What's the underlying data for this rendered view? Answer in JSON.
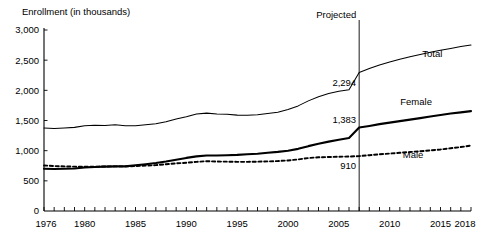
{
  "chart_data": {
    "type": "line",
    "title": "Enrollment (in thousands)",
    "xlabel": "",
    "ylabel": "Enrollment (in thousands)",
    "xlim": [
      1976,
      2018
    ],
    "ylim": [
      0,
      3000
    ],
    "grid": false,
    "legend_position": "inline-right",
    "y_ticks": [
      "0",
      "500",
      "1,000",
      "1,500",
      "2,000",
      "2,500",
      "3,000"
    ],
    "y_tick_values": [
      0,
      500,
      1000,
      1500,
      2000,
      2500,
      3000
    ],
    "x_ticks": [
      "1976",
      "1980",
      "1985",
      "1990",
      "1995",
      "2000",
      "2005",
      "2010",
      "2015",
      "2018"
    ],
    "x_tick_values": [
      1976,
      1980,
      1985,
      1990,
      1995,
      2000,
      2005,
      2010,
      2015,
      2018
    ],
    "x": [
      1976,
      1977,
      1978,
      1979,
      1980,
      1981,
      1982,
      1983,
      1984,
      1985,
      1986,
      1987,
      1988,
      1989,
      1990,
      1991,
      1992,
      1993,
      1994,
      1995,
      1996,
      1997,
      1998,
      1999,
      2000,
      2001,
      2002,
      2003,
      2004,
      2005,
      2006,
      2007,
      2008,
      2009,
      2010,
      2011,
      2012,
      2013,
      2014,
      2015,
      2016,
      2017,
      2018
    ],
    "series": [
      {
        "name": "Total",
        "style": "thin-solid",
        "values": [
          1377,
          1366,
          1375,
          1386,
          1412,
          1422,
          1416,
          1430,
          1412,
          1412,
          1430,
          1447,
          1479,
          1526,
          1563,
          1609,
          1622,
          1608,
          1603,
          1589,
          1587,
          1595,
          1615,
          1638,
          1684,
          1742,
          1825,
          1895,
          1946,
          1984,
          2010,
          2294,
          2360,
          2420,
          2470,
          2515,
          2555,
          2595,
          2630,
          2665,
          2695,
          2725,
          2750
        ]
      },
      {
        "name": "Female",
        "style": "thick-solid",
        "values": [
          700,
          695,
          700,
          705,
          720,
          730,
          735,
          740,
          740,
          757,
          775,
          795,
          820,
          850,
          880,
          905,
          920,
          920,
          925,
          930,
          940,
          950,
          965,
          980,
          1000,
          1030,
          1075,
          1115,
          1150,
          1180,
          1210,
          1383,
          1410,
          1440,
          1465,
          1490,
          1515,
          1540,
          1565,
          1590,
          1615,
          1635,
          1655
        ]
      },
      {
        "name": "Male",
        "style": "dotted",
        "values": [
          755,
          745,
          740,
          735,
          735,
          735,
          738,
          740,
          740,
          745,
          752,
          760,
          775,
          790,
          800,
          815,
          825,
          820,
          818,
          815,
          815,
          818,
          822,
          828,
          838,
          855,
          878,
          890,
          895,
          900,
          903,
          910,
          925,
          940,
          952,
          965,
          978,
          990,
          1005,
          1020,
          1040,
          1060,
          1085
        ]
      }
    ],
    "annotations": [
      {
        "name": "projected-label",
        "text": "Projected",
        "x": 2007
      },
      {
        "name": "total-value-2007",
        "text": "2,294",
        "x": 2007,
        "y": 2294
      },
      {
        "name": "female-value-2007",
        "text": "1,383",
        "x": 2007,
        "y": 1383
      },
      {
        "name": "male-value-2007",
        "text": "910",
        "x": 2007,
        "y": 910
      }
    ],
    "series_labels": [
      {
        "name": "Total",
        "text": "Total"
      },
      {
        "name": "Female",
        "text": "Female"
      },
      {
        "name": "Male",
        "text": "Male"
      }
    ]
  }
}
